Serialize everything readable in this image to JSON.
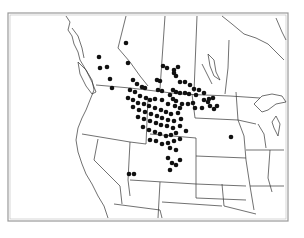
{
  "map": {
    "title": "",
    "region": "Western & Central North America",
    "frame_color": "#888888",
    "boundary_color": "#333333",
    "dot_color": "#111111",
    "dot_radius": 2.3,
    "points": [
      [
        126,
        43
      ],
      [
        99,
        57
      ],
      [
        107,
        67
      ],
      [
        100,
        68
      ],
      [
        110,
        79
      ],
      [
        112,
        88
      ],
      [
        128,
        63
      ],
      [
        133,
        80
      ],
      [
        137,
        84
      ],
      [
        142,
        87
      ],
      [
        145,
        88
      ],
      [
        163,
        66
      ],
      [
        167,
        68
      ],
      [
        174,
        70
      ],
      [
        178,
        67
      ],
      [
        174,
        73
      ],
      [
        176,
        76
      ],
      [
        157,
        80
      ],
      [
        160,
        81
      ],
      [
        180,
        82
      ],
      [
        185,
        82
      ],
      [
        190,
        85
      ],
      [
        194,
        89
      ],
      [
        199,
        90
      ],
      [
        204,
        93
      ],
      [
        209,
        99
      ],
      [
        213,
        98
      ],
      [
        173,
        90
      ],
      [
        176,
        92
      ],
      [
        180,
        93
      ],
      [
        185,
        93
      ],
      [
        189,
        94
      ],
      [
        196,
        95
      ],
      [
        204,
        100
      ],
      [
        208,
        102
      ],
      [
        210,
        106
      ],
      [
        214,
        109
      ],
      [
        217,
        106
      ],
      [
        158,
        90
      ],
      [
        162,
        91
      ],
      [
        170,
        95
      ],
      [
        173,
        99
      ],
      [
        176,
        101
      ],
      [
        182,
        104
      ],
      [
        188,
        104
      ],
      [
        193,
        103
      ],
      [
        195,
        108
      ],
      [
        202,
        108
      ],
      [
        130,
        90
      ],
      [
        135,
        92
      ],
      [
        140,
        96
      ],
      [
        146,
        98
      ],
      [
        150,
        100
      ],
      [
        155,
        99
      ],
      [
        162,
        100
      ],
      [
        168,
        104
      ],
      [
        175,
        106
      ],
      [
        180,
        108
      ],
      [
        128,
        98
      ],
      [
        133,
        100
      ],
      [
        138,
        103
      ],
      [
        144,
        104
      ],
      [
        149,
        106
      ],
      [
        155,
        108
      ],
      [
        161,
        110
      ],
      [
        166,
        112
      ],
      [
        171,
        114
      ],
      [
        178,
        113
      ],
      [
        133,
        107
      ],
      [
        139,
        110
      ],
      [
        145,
        112
      ],
      [
        151,
        114
      ],
      [
        157,
        116
      ],
      [
        162,
        118
      ],
      [
        168,
        120
      ],
      [
        174,
        121
      ],
      [
        181,
        119
      ],
      [
        138,
        117
      ],
      [
        144,
        119
      ],
      [
        150,
        121
      ],
      [
        156,
        123
      ],
      [
        161,
        125
      ],
      [
        167,
        126
      ],
      [
        173,
        128
      ],
      [
        180,
        126
      ],
      [
        143,
        127
      ],
      [
        149,
        130
      ],
      [
        155,
        132
      ],
      [
        160,
        134
      ],
      [
        166,
        136
      ],
      [
        171,
        135
      ],
      [
        176,
        133
      ],
      [
        186,
        131
      ],
      [
        150,
        140
      ],
      [
        156,
        141
      ],
      [
        162,
        144
      ],
      [
        168,
        143
      ],
      [
        174,
        141
      ],
      [
        180,
        139
      ],
      [
        170,
        148
      ],
      [
        176,
        150
      ],
      [
        168,
        158
      ],
      [
        172,
        163
      ],
      [
        176,
        165
      ],
      [
        180,
        160
      ],
      [
        170,
        170
      ],
      [
        129,
        174
      ],
      [
        134,
        174
      ],
      [
        231,
        137
      ]
    ]
  }
}
